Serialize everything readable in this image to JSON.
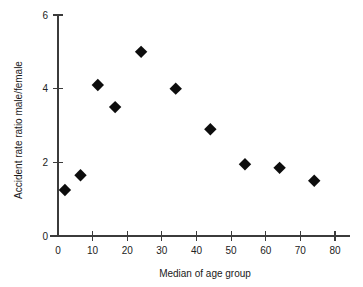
{
  "chart_data": {
    "type": "scatter",
    "title": "",
    "xlabel": "Median of age group",
    "ylabel": "Accident rate ratio male/female",
    "xlim": [
      0,
      85
    ],
    "ylim": [
      0,
      6
    ],
    "xticks": [
      0,
      10,
      20,
      30,
      40,
      50,
      60,
      70,
      80
    ],
    "xtick_labels": [
      "0",
      "10",
      "20",
      "30",
      "40",
      "50",
      "60",
      "70",
      "80"
    ],
    "yticks": [
      0,
      2,
      4,
      6
    ],
    "ytick_labels": [
      "0",
      "2",
      "4",
      "6"
    ],
    "grid": false,
    "legend": false,
    "marker": "diamond",
    "marker_color": "#0d0d0d",
    "x": [
      2,
      6.5,
      11.5,
      16.5,
      24,
      34,
      44,
      54,
      64,
      74
    ],
    "y": [
      1.25,
      1.65,
      4.1,
      3.5,
      5.0,
      4.0,
      2.9,
      1.95,
      1.85,
      1.5
    ],
    "points": [
      {
        "x": 2,
        "y": 1.25
      },
      {
        "x": 6.5,
        "y": 1.65
      },
      {
        "x": 11.5,
        "y": 4.1
      },
      {
        "x": 16.5,
        "y": 3.5
      },
      {
        "x": 24,
        "y": 5.0
      },
      {
        "x": 34,
        "y": 4.0
      },
      {
        "x": 44,
        "y": 2.9
      },
      {
        "x": 54,
        "y": 1.95
      },
      {
        "x": 64,
        "y": 1.85
      },
      {
        "x": 74,
        "y": 1.5
      }
    ]
  }
}
